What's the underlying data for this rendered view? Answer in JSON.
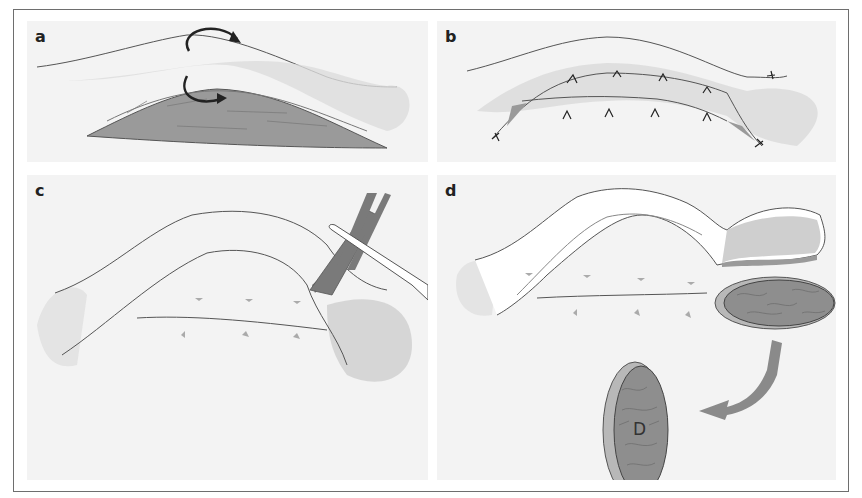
{
  "figure": {
    "panels": [
      {
        "id": "a",
        "label": "a",
        "description": "Eyelid cross-section with curved arrows indicating rotation of tissue"
      },
      {
        "id": "b",
        "label": "b",
        "description": "Sutured eyelid layers with interrupted sutures"
      },
      {
        "id": "c",
        "label": "c",
        "description": "Forceps and scissors incising tissue at the lateral end"
      },
      {
        "id": "d",
        "label": "d",
        "description": "Graft harvested and transferred, arrow pointing to graft"
      }
    ],
    "graft_label": "D",
    "colors": {
      "background": "#f3f3f3",
      "frame": "#6e6e6e",
      "outline": "#555555",
      "tissue_gray": "#bdbdbd",
      "graft_fill": "#8e8e8e",
      "arrow_gray": "#8a8a8a",
      "instrument": "#7a7a7a"
    }
  }
}
